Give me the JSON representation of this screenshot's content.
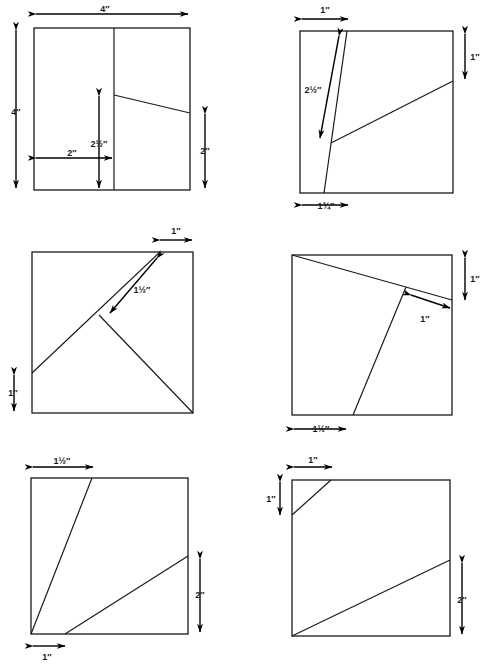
{
  "page": {
    "title_fragment": "",
    "width": 486,
    "height": 668,
    "background_color": "#ffffff",
    "line_color": "#1a1a1a",
    "arrow_color": "#000000"
  },
  "figure": {
    "panel_count": 6,
    "unit_symbol": "″"
  },
  "panels": [
    {
      "id": "panel-1",
      "position": "top-left",
      "square": {
        "left": 34,
        "top": 28,
        "size": 163
      },
      "labels": [
        {
          "name": "top-width",
          "text": "4″",
          "x": 52,
          "y": 16
        },
        {
          "name": "left-height",
          "text": "4″",
          "x": 16,
          "y": 112
        },
        {
          "name": "vertical-inner",
          "text": "2½″",
          "x": 94,
          "y": 142
        },
        {
          "name": "bottom-offset",
          "text": "2″",
          "x": 72,
          "y": 158
        },
        {
          "name": "right-height",
          "text": "2″",
          "x": 204,
          "y": 152
        }
      ]
    },
    {
      "id": "panel-2",
      "position": "top-right",
      "square": {
        "left": 300,
        "top": 31,
        "size": 157
      },
      "labels": [
        {
          "name": "top-offset",
          "text": "1″",
          "x": 315,
          "y": 17
        },
        {
          "name": "right-drop",
          "text": "1″",
          "x": 466,
          "y": 54
        },
        {
          "name": "slant-length",
          "text": "2½″",
          "x": 323,
          "y": 100
        },
        {
          "name": "bottom-offset",
          "text": "1¾″",
          "x": 326,
          "y": 208
        }
      ]
    },
    {
      "id": "panel-3",
      "position": "middle-left",
      "square": {
        "left": 32,
        "top": 252,
        "size": 160
      },
      "labels": [
        {
          "name": "top-offset",
          "text": "1″",
          "x": 176,
          "y": 238
        },
        {
          "name": "branch-length",
          "text": "1½″",
          "x": 126,
          "y": 294
        },
        {
          "name": "left-rise",
          "text": "1″",
          "x": 13,
          "y": 393
        }
      ]
    },
    {
      "id": "panel-4",
      "position": "middle-right",
      "square": {
        "left": 292,
        "top": 255,
        "size": 160
      },
      "labels": [
        {
          "name": "right-drop",
          "text": "1″",
          "x": 466,
          "y": 287
        },
        {
          "name": "right-gap",
          "text": "1″",
          "x": 424,
          "y": 322
        },
        {
          "name": "bottom-offset",
          "text": "1½″",
          "x": 313,
          "y": 432
        }
      ]
    },
    {
      "id": "panel-5",
      "position": "bottom-left",
      "square": {
        "left": 31,
        "top": 478,
        "size": 157
      },
      "labels": [
        {
          "name": "top-offset",
          "text": "1½″",
          "x": 53,
          "y": 468
        },
        {
          "name": "right-height",
          "text": "2″",
          "x": 204,
          "y": 593
        },
        {
          "name": "bottom-offset",
          "text": "1″",
          "x": 44,
          "y": 660
        }
      ]
    },
    {
      "id": "panel-6",
      "position": "bottom-right",
      "square": {
        "left": 292,
        "top": 480,
        "size": 158
      },
      "labels": [
        {
          "name": "top-offset",
          "text": "1″",
          "x": 312,
          "y": 468
        },
        {
          "name": "left-drop",
          "text": "1″",
          "x": 277,
          "y": 508
        },
        {
          "name": "right-height",
          "text": "2″",
          "x": 464,
          "y": 600
        }
      ]
    }
  ]
}
